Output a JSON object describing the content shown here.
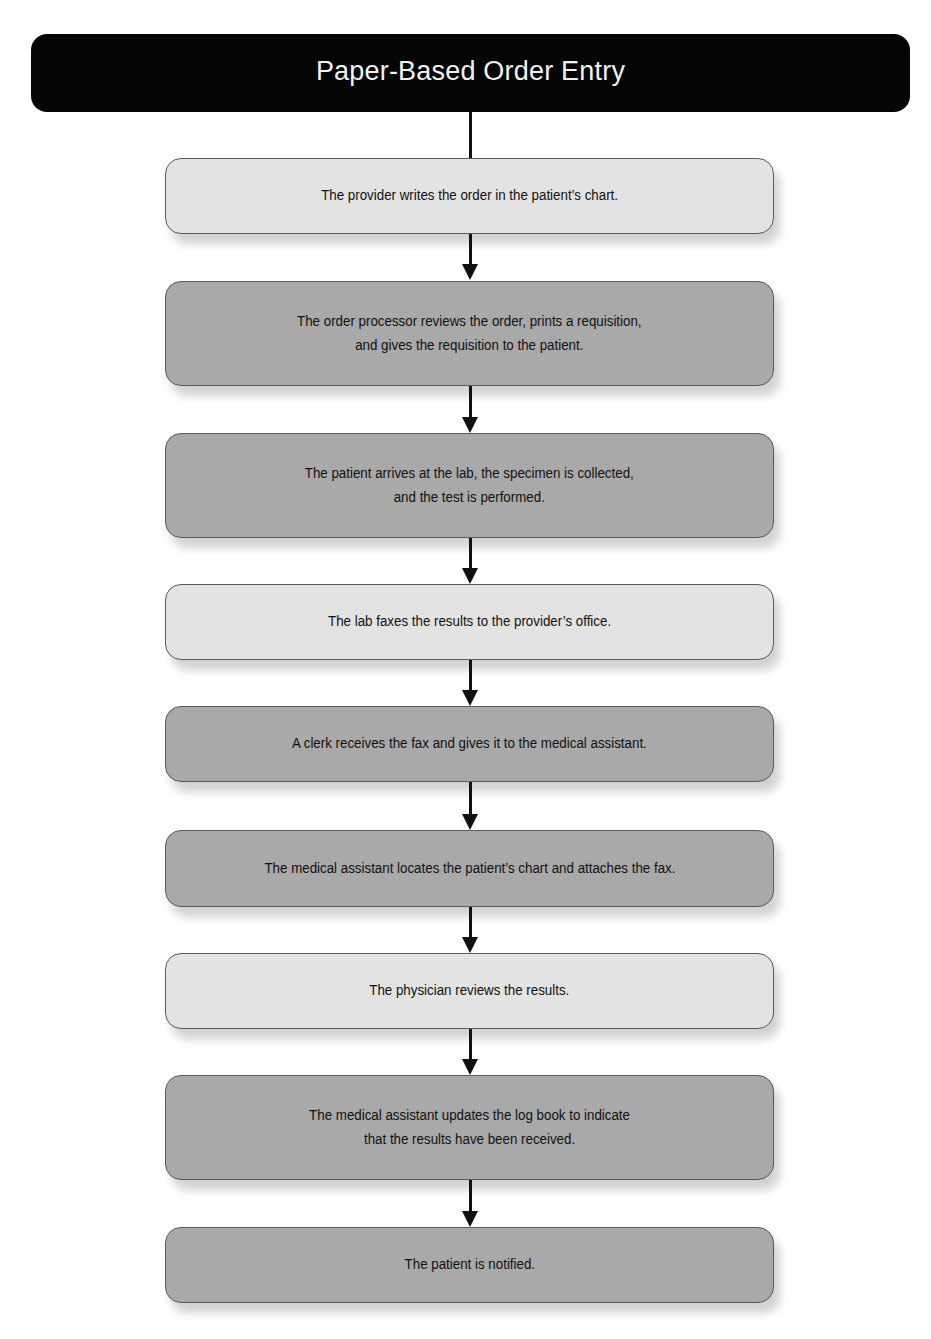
{
  "diagram": {
    "title": "Paper-Based Order Entry",
    "colors": {
      "title_bg": "#050505",
      "title_text": "#f2f2f2",
      "light_step": "#e3e3e3",
      "dark_step": "#a9a9a9",
      "connector": "#111111"
    },
    "steps": [
      {
        "text": "The provider writes the order in the patient’s chart.",
        "shade": "light"
      },
      {
        "text": "The order processor reviews the order, prints a requisition,\nand gives the requisition to the patient.",
        "shade": "dark"
      },
      {
        "text": "The patient arrives at the lab, the specimen is collected,\nand the test is performed.",
        "shade": "dark"
      },
      {
        "text": "The lab faxes the results to the provider’s office.",
        "shade": "light"
      },
      {
        "text": "A clerk receives the fax and gives it to the medical assistant.",
        "shade": "dark"
      },
      {
        "text": "The medical assistant locates the patient’s chart and attaches the fax.",
        "shade": "dark"
      },
      {
        "text": "The physician reviews the results.",
        "shade": "light"
      },
      {
        "text": "The medical assistant updates the log book to indicate\nthat the results have been received.",
        "shade": "dark"
      },
      {
        "text": "The patient is notified.",
        "shade": "dark"
      }
    ]
  }
}
